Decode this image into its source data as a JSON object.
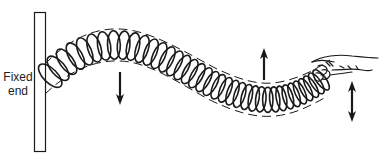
{
  "diagram": {
    "type": "transverse wave on a spring",
    "labels": {
      "fixed_end_line1": "Fixed",
      "fixed_end_line2": "end"
    },
    "colors": {
      "stroke": "#1a1a1a",
      "background": "#ffffff"
    },
    "elements": [
      {
        "name": "fixed-wall",
        "description": "vertical plate at left where spring is attached"
      },
      {
        "name": "spring",
        "description": "coiled spring forming a sinusoidal wave, coils compressed toward the right"
      },
      {
        "name": "envelope",
        "description": "dashed lines above and below spring outlining the wave"
      },
      {
        "name": "arrow-down",
        "description": "downward arrow under the wave crest"
      },
      {
        "name": "arrow-up",
        "description": "upward arrow above the wave trough"
      },
      {
        "name": "arrow-double",
        "description": "double-headed vertical arrow beside the hand indicating up-down motion"
      },
      {
        "name": "hand",
        "description": "hand holding free end of the spring"
      }
    ]
  }
}
